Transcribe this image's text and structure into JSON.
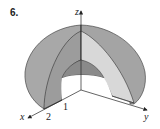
{
  "problem": {
    "number": "6."
  },
  "axes": {
    "x_label": "x",
    "y_label": "y",
    "z_label": "z"
  },
  "ticks": {
    "inner_radius": "1",
    "outer_radius": "2"
  },
  "colors": {
    "outer_surface": "#a9a9a9",
    "cut_face_light": "#d6d6d6",
    "cut_face_dark": "#9e9e9e",
    "inner_surface": "#8c8c8c",
    "lines": "#333333"
  }
}
